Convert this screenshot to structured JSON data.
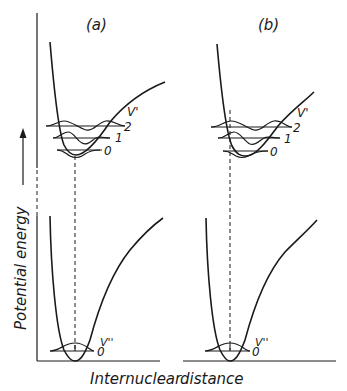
{
  "figure": {
    "panel_a": {
      "label": "(a)"
    },
    "panel_b": {
      "label": "(b)"
    },
    "y_axis_label": "Potential energy",
    "x_axis_label_left": "Internuclear",
    "x_axis_label_right": "distance",
    "upper_state": {
      "quantum_number_label": "V'",
      "levels": [
        "0",
        "1",
        "2"
      ]
    },
    "lower_state": {
      "quantum_number_label": "V''",
      "levels": [
        "0"
      ]
    },
    "colors": {
      "ink": "#1a1a1a",
      "background": "#ffffff"
    }
  }
}
